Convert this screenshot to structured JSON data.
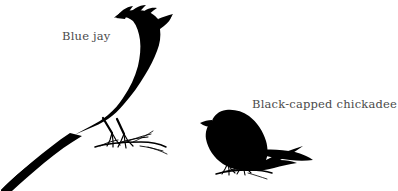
{
  "figure": {
    "kind": "bird-size-comparison-silhouettes",
    "background_color": "#ffffff",
    "silhouette_color": "#000000",
    "label_color": "#4a4a4a"
  },
  "labels": {
    "blue_jay": "Blue jay",
    "chickadee": "Black-capped chickadee"
  },
  "birds": [
    {
      "id": "blue-jay",
      "common_name": "Blue jay",
      "label": "Blue jay",
      "relative_size": "large",
      "features": [
        "crest",
        "long tail",
        "perched on twig"
      ]
    },
    {
      "id": "black-capped-chickadee",
      "common_name": "Black-capped chickadee",
      "label": "Black-capped chickadee",
      "relative_size": "small",
      "features": [
        "rounded body",
        "short tail",
        "perched on twig"
      ]
    }
  ]
}
